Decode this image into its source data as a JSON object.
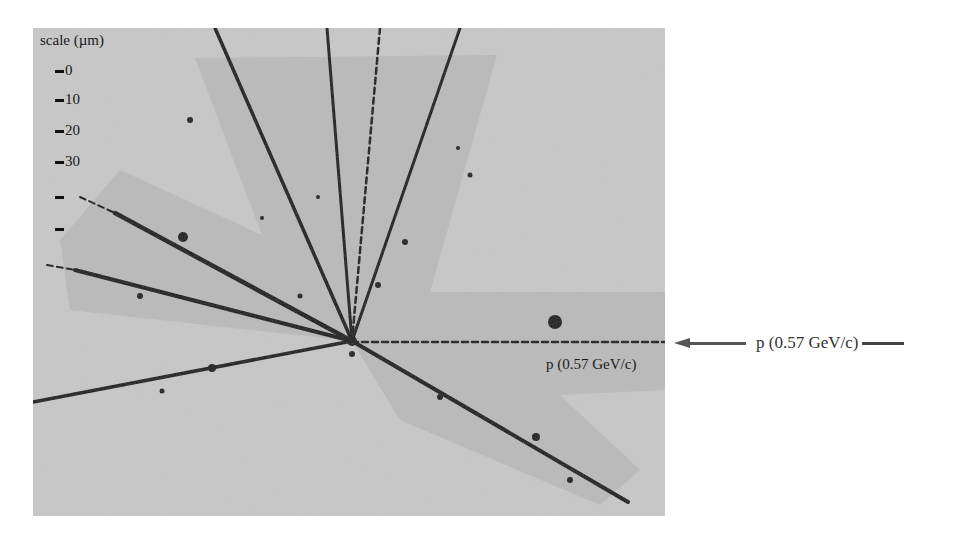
{
  "figure": {
    "photo": {
      "x": 33,
      "y": 28,
      "width": 632,
      "height": 488,
      "background": "#c9c9c9",
      "shade_color": "#b4b4b4",
      "track_color": "#111111",
      "vertex": {
        "x": 352,
        "y": 341
      }
    },
    "scale": {
      "title": "scale (µm)",
      "marks": [
        {
          "label": "0",
          "y": 62
        },
        {
          "label": "10",
          "y": 91
        },
        {
          "label": "20",
          "y": 122
        },
        {
          "label": "30",
          "y": 153
        },
        {
          "label": "",
          "y": 188
        },
        {
          "label": "",
          "y": 220
        }
      ]
    },
    "shaded_bands": [
      {
        "name": "upper-wedge",
        "points": "195,58 497,55 430,292 352,341 262,235"
      },
      {
        "name": "left-wedge",
        "points": "120,170 262,235 352,341 70,310 60,240"
      },
      {
        "name": "right-band",
        "points": "352,341 430,292 665,292 665,390 560,395"
      },
      {
        "name": "lower-right-band",
        "points": "352,341 560,395 640,470 600,505 400,420"
      }
    ],
    "tracks": [
      {
        "name": "track-upper-left",
        "x1": 215,
        "y1": 28,
        "x2": 352,
        "y2": 341,
        "width": 3.5,
        "dashed": false
      },
      {
        "name": "track-upper-center-left",
        "x1": 327,
        "y1": 28,
        "x2": 352,
        "y2": 341,
        "width": 3,
        "dashed": false
      },
      {
        "name": "track-upper-center",
        "x1": 380,
        "y1": 28,
        "x2": 352,
        "y2": 341,
        "width": 2.5,
        "dashed": true
      },
      {
        "name": "track-upper-right",
        "x1": 460,
        "y1": 28,
        "x2": 352,
        "y2": 341,
        "width": 3,
        "dashed": false
      },
      {
        "name": "track-left-upper",
        "x1": 115,
        "y1": 213,
        "x2": 352,
        "y2": 341,
        "width": 4.5,
        "dashed": false
      },
      {
        "name": "track-left-upper-faint",
        "x1": 80,
        "y1": 197,
        "x2": 115,
        "y2": 213,
        "width": 2,
        "dashed": true
      },
      {
        "name": "track-left-middle",
        "x1": 75,
        "y1": 270,
        "x2": 352,
        "y2": 341,
        "width": 4,
        "dashed": false
      },
      {
        "name": "track-left-middle-faint",
        "x1": 47,
        "y1": 265,
        "x2": 75,
        "y2": 270,
        "width": 2,
        "dashed": true
      },
      {
        "name": "track-left-lower",
        "x1": 33,
        "y1": 402,
        "x2": 352,
        "y2": 341,
        "width": 3.5,
        "dashed": false
      },
      {
        "name": "track-lower-right",
        "x1": 352,
        "y1": 341,
        "x2": 628,
        "y2": 502,
        "width": 4,
        "dashed": false
      },
      {
        "name": "beam-track",
        "x1": 352,
        "y1": 342,
        "x2": 665,
        "y2": 342,
        "width": 2.5,
        "dashed": true
      }
    ],
    "blobs": [
      {
        "x": 555,
        "y": 322,
        "r": 7
      },
      {
        "x": 183,
        "y": 237,
        "r": 5
      },
      {
        "x": 212,
        "y": 368,
        "r": 4
      },
      {
        "x": 536,
        "y": 437,
        "r": 4
      },
      {
        "x": 140,
        "y": 296,
        "r": 3
      },
      {
        "x": 190,
        "y": 120,
        "r": 3
      },
      {
        "x": 405,
        "y": 242,
        "r": 3
      },
      {
        "x": 378,
        "y": 285,
        "r": 3
      },
      {
        "x": 440,
        "y": 397,
        "r": 3
      },
      {
        "x": 570,
        "y": 480,
        "r": 3
      },
      {
        "x": 162,
        "y": 391,
        "r": 2.5
      },
      {
        "x": 300,
        "y": 296,
        "r": 2.5
      },
      {
        "x": 470,
        "y": 175,
        "r": 2.5
      },
      {
        "x": 458,
        "y": 148,
        "r": 2
      },
      {
        "x": 262,
        "y": 218,
        "r": 2
      },
      {
        "x": 318,
        "y": 197,
        "r": 2
      },
      {
        "x": 352,
        "y": 354,
        "r": 3
      }
    ],
    "in_photo_label": "p (0.57 GeV/c)",
    "beam_annotation": {
      "label": "p (0.57 GeV/c)",
      "arrow_direction": "left"
    }
  }
}
